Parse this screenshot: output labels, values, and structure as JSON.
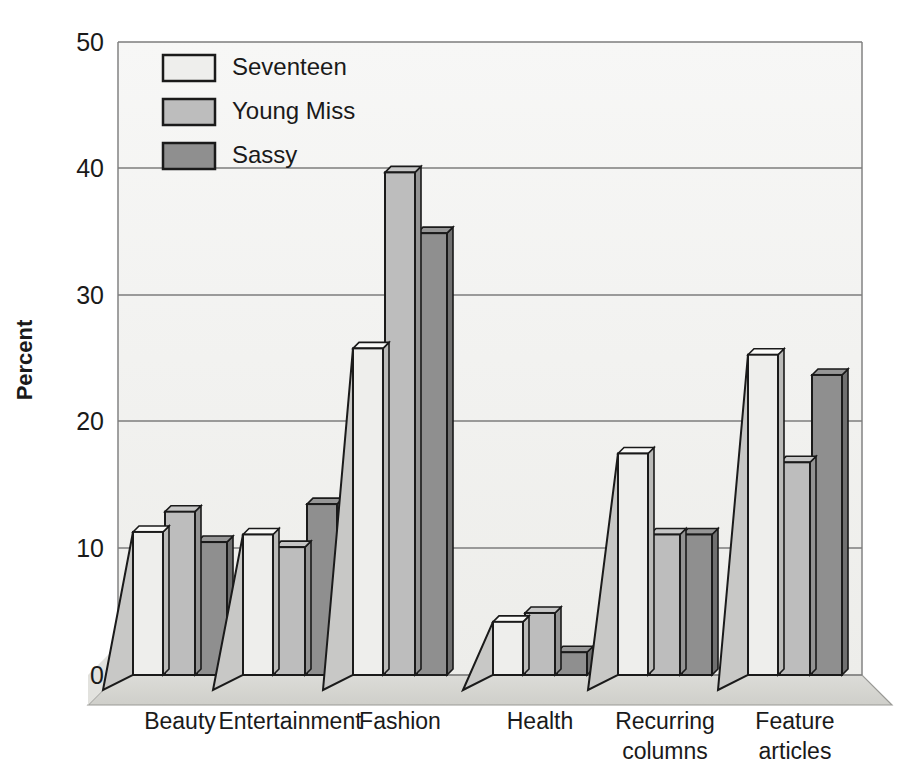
{
  "chart_data": {
    "type": "bar",
    "title": "",
    "xlabel": "",
    "ylabel": "Percent",
    "ylim": [
      0,
      50
    ],
    "yticks": [
      0,
      10,
      20,
      30,
      40,
      50
    ],
    "ytick_labels": [
      "0",
      "10",
      "20",
      "30",
      "40",
      "50"
    ],
    "grid": true,
    "legend_position": "top-left inside",
    "style": "3d-perspective-grouped-bars",
    "categories": [
      "Beauty",
      "Entertainment",
      "Fashion",
      "Health",
      "Recurring columns",
      "Feature articles"
    ],
    "category_label_lines": [
      [
        "Beauty"
      ],
      [
        "Entertainment"
      ],
      [
        "Fashion"
      ],
      [
        "Health"
      ],
      [
        "Recurring",
        "columns"
      ],
      [
        "Feature",
        "articles"
      ]
    ],
    "series": [
      {
        "name": "Seventeen",
        "color": "#eeeeec",
        "values": [
          11.3,
          11.1,
          25.8,
          4.2,
          17.5,
          25.3
        ]
      },
      {
        "name": "Young Miss",
        "color": "#bdbdbd",
        "values": [
          12.9,
          10.1,
          39.7,
          4.9,
          11.1,
          16.8
        ]
      },
      {
        "name": "Sassy",
        "color": "#8f8f8f",
        "values": [
          10.5,
          13.5,
          34.9,
          1.8,
          11.1,
          23.7
        ]
      }
    ]
  },
  "legend": {
    "entries": [
      {
        "label": "Seventeen",
        "swatch": "#eeeeec"
      },
      {
        "label": "Young Miss",
        "swatch": "#bdbdbd"
      },
      {
        "label": "Sassy",
        "swatch": "#8f8f8f"
      }
    ]
  },
  "axes": {
    "y_title": "Percent",
    "y_tick_0": "0",
    "y_tick_10": "10",
    "y_tick_20": "20",
    "y_tick_30": "30",
    "y_tick_40": "40",
    "y_tick_50": "50"
  },
  "colors": {
    "series_seventeen": "#eeeeec",
    "series_young_miss": "#bdbdbd",
    "series_sassy": "#8f8f8f",
    "gridline": "#7d7d7d",
    "outline": "#1a1a1a",
    "panel_background": "#f3f3f1",
    "floor": "#d6d6d2",
    "text": "#1a1a1a"
  }
}
